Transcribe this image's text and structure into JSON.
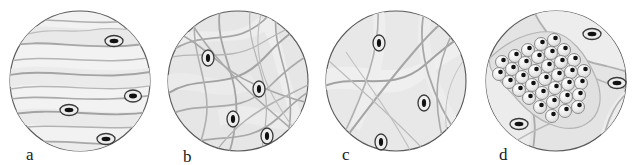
{
  "figure": {
    "type": "scientific-illustration-series",
    "background_color": "#ffffff",
    "panel_count": 4
  },
  "style": {
    "circle_stroke": "#5a5a5a",
    "circle_fill": "#f0f0f0",
    "fiber_stroke": "#a8a8a8",
    "fiber_stroke_light": "#c4c4c4",
    "compartment_fill": "#e4e4e4",
    "cell_outline": "#3a3a3a",
    "cell_fill": "#ededed",
    "nucleus_color": "#111111",
    "cluster_cell_fill": "#e8e8e8",
    "label_color": "#1a1a1a"
  },
  "panels": [
    {
      "id": "a",
      "label": "a",
      "label_x": 26,
      "label_y": 2,
      "circle": {
        "cx": 80,
        "cy": 81,
        "r": 70
      },
      "pattern": "wavy-parallel-fibers",
      "cells": [
        {
          "cx": 114,
          "cy": 41,
          "rx": 9,
          "ry": 5.5
        },
        {
          "cx": 133,
          "cy": 96,
          "rx": 8.5,
          "ry": 6
        },
        {
          "cx": 69,
          "cy": 110,
          "rx": 9,
          "ry": 5.5
        },
        {
          "cx": 106,
          "cy": 139,
          "rx": 9,
          "ry": 5.5
        }
      ]
    },
    {
      "id": "b",
      "label": "b",
      "label_x": 25,
      "label_y": 0,
      "circle": {
        "cx": 80,
        "cy": 81,
        "r": 70
      },
      "pattern": "dense-crossing-network",
      "cells": [
        {
          "cx": 50,
          "cy": 58,
          "rx": 6,
          "ry": 8
        },
        {
          "cx": 101,
          "cy": 89,
          "rx": 6,
          "ry": 8
        },
        {
          "cx": 75,
          "cy": 119,
          "rx": 6,
          "ry": 8
        },
        {
          "cx": 109,
          "cy": 136,
          "rx": 6,
          "ry": 8
        }
      ]
    },
    {
      "id": "c",
      "label": "c",
      "label_x": 26,
      "label_y": 2,
      "circle": {
        "cx": 80,
        "cy": 81,
        "r": 70
      },
      "pattern": "sparse-crossing-curves",
      "cells": [
        {
          "cx": 63,
          "cy": 43,
          "rx": 6,
          "ry": 8
        },
        {
          "cx": 108,
          "cy": 103,
          "rx": 6,
          "ry": 8
        },
        {
          "cx": 65,
          "cy": 142,
          "rx": 6,
          "ry": 8
        }
      ]
    },
    {
      "id": "d",
      "label": "d",
      "label_x": 25,
      "label_y": 2,
      "circle": {
        "cx": 82,
        "cy": 81,
        "r": 70
      },
      "pattern": "diagonal-cell-cluster-band",
      "cells": [
        {
          "cx": 118,
          "cy": 34,
          "rx": 9,
          "ry": 5.5
        },
        {
          "cx": 143,
          "cy": 83,
          "rx": 9,
          "ry": 5.5
        },
        {
          "cx": 45,
          "cy": 124,
          "rx": 9,
          "ry": 5.5
        }
      ],
      "cluster": {
        "cell_count": 34,
        "cell_radius": 6.5,
        "orientation": "diagonal-upper-left-to-lower-right"
      }
    }
  ]
}
